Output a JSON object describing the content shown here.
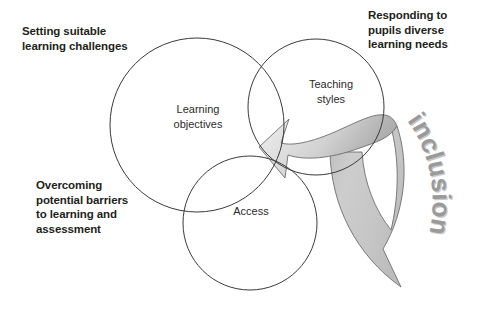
{
  "diagram": {
    "circles": [
      {
        "id": "learning-objectives",
        "label": "Learning\nobjectives",
        "line1": "Learning",
        "line2": "objectives"
      },
      {
        "id": "teaching-styles",
        "label": "Teaching\nstyles",
        "line1": "Teaching",
        "line2": "styles"
      },
      {
        "id": "access",
        "label": "Access",
        "line1": "Access",
        "line2": ""
      }
    ],
    "callouts": [
      {
        "id": "top-left",
        "text": "Setting suitable\nlearning challenges"
      },
      {
        "id": "top-right",
        "text": "Responding to\npupils diverse\nlearning needs"
      },
      {
        "id": "bottom-left",
        "text": "Overcoming\npotential barriers\nto learning and\nassessment"
      }
    ],
    "arrow_band": {
      "id": "inclusion-arrow",
      "word": "inclusion",
      "letters": [
        "i",
        "n",
        "c",
        "l",
        "u",
        "s",
        "i",
        "o",
        "n"
      ]
    },
    "colors": {
      "background": "#ffffff",
      "circle_stroke": "#3a3a3a",
      "circle_label": "#2b2b2b",
      "callout_text": "#231f20",
      "band_stroke": "#6d6d6d",
      "band_light": "#f4f4f4",
      "band_mid": "#d8d8d8",
      "band_dark": "#b9b9b9",
      "inclusion_fill": "#9a9a9a",
      "inclusion_shadow": "#c9c9c9"
    }
  }
}
